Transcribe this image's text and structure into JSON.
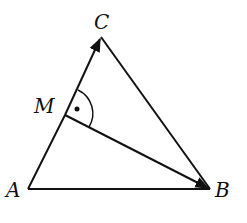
{
  "diagram": {
    "type": "geometry-triangle",
    "points": {
      "A": {
        "label": "A",
        "x": 28,
        "y": 189
      },
      "B": {
        "label": "B",
        "x": 210,
        "y": 189
      },
      "C": {
        "label": "C",
        "x": 101,
        "y": 37
      },
      "M": {
        "label": "M",
        "x": 65,
        "y": 115
      }
    },
    "segments": [
      "AB",
      "BC",
      "AM"
    ],
    "vectors": [
      "MC",
      "MB"
    ],
    "angle_marks": [
      {
        "vertex": "M",
        "between": [
          "MC",
          "MB"
        ],
        "mark": "arc-with-dot"
      }
    ],
    "stroke_color": "#111111"
  }
}
